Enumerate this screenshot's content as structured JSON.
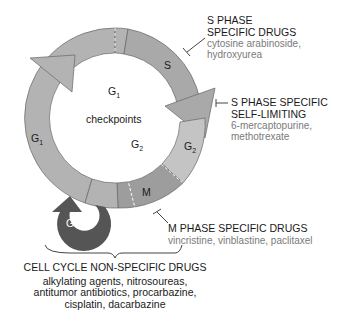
{
  "ring": {
    "phases": {
      "s": "S",
      "g2": "G",
      "g2_sub": "2",
      "m": "M",
      "g1": "G",
      "g1_sub": "1",
      "g0": "G",
      "g0_sub": "O"
    },
    "inner": {
      "g1": "G",
      "g1_sub": "1",
      "g2": "G",
      "g2_sub": "2",
      "checkpoints": "checkpoints"
    }
  },
  "labels": {
    "s_phase": {
      "title1": "S PHASE",
      "title2": "SPECIFIC DRUGS",
      "drugs1": "cytosine arabinoside,",
      "drugs2": "hydroxyurea"
    },
    "s_self": {
      "title1": "S PHASE SPECIFIC",
      "title2": "SELF-LIMITING",
      "drugs1": "6-mercaptopurine,",
      "drugs2": "methotrexate"
    },
    "m_phase": {
      "title": "M PHASE SPECIFIC DRUGS",
      "drugs": "vincristine, vinblastine, paclitaxel"
    },
    "non_specific": {
      "title": "CELL CYCLE NON-SPECIFIC DRUGS",
      "drugs1": "alkylating agents, nitrosoureas,",
      "drugs2": "antitumor antibiotics, procarbazine,",
      "drugs3": "cisplatin, dacarbazine"
    }
  },
  "colors": {
    "ring": "#b3b3b3",
    "s": "#a9a9a9",
    "g2": "#c4c4c4",
    "m": "#9d9d9d",
    "g0": "#555555",
    "text": "#1a1a1a",
    "sub": "#7a7a7a"
  }
}
